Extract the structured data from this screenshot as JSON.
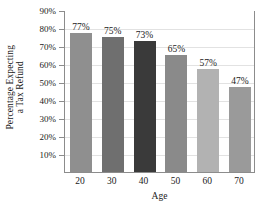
{
  "chart_data": {
    "type": "bar",
    "title": "",
    "subtitle": "",
    "xlabel": "Age",
    "ylabel_lines": [
      "Percentage Expecting",
      "a Tax Refund"
    ],
    "ylabel": "Percentage Expecting a Tax Refund",
    "categories": [
      "20",
      "30",
      "40",
      "50",
      "60",
      "70"
    ],
    "values": [
      77,
      75,
      73,
      65,
      57,
      47
    ],
    "value_labels": [
      "77%",
      "75%",
      "73%",
      "65%",
      "57%",
      "47%"
    ],
    "bar_colors": [
      "#8f8f8f",
      "#6f6f6f",
      "#3a3a3a",
      "#8a8a8a",
      "#b2b2b2",
      "#9a9a9a"
    ],
    "ylim": [
      0,
      90
    ],
    "ytick_values": [
      90,
      80,
      70,
      60,
      50,
      40,
      30,
      20,
      10
    ],
    "ytick_labels": [
      "90%",
      "80%",
      "70%",
      "60%",
      "50%",
      "40%",
      "30%",
      "20%",
      "10%"
    ],
    "xtick_labels": [
      "20",
      "30",
      "40",
      "50",
      "60",
      "70"
    ],
    "grid": "horizontal",
    "gridline_color": "#e2e2e2",
    "legend": "none",
    "frame_color": "#8c8c8c",
    "background": "#ffffff",
    "text_color": "#1a1a1a"
  }
}
